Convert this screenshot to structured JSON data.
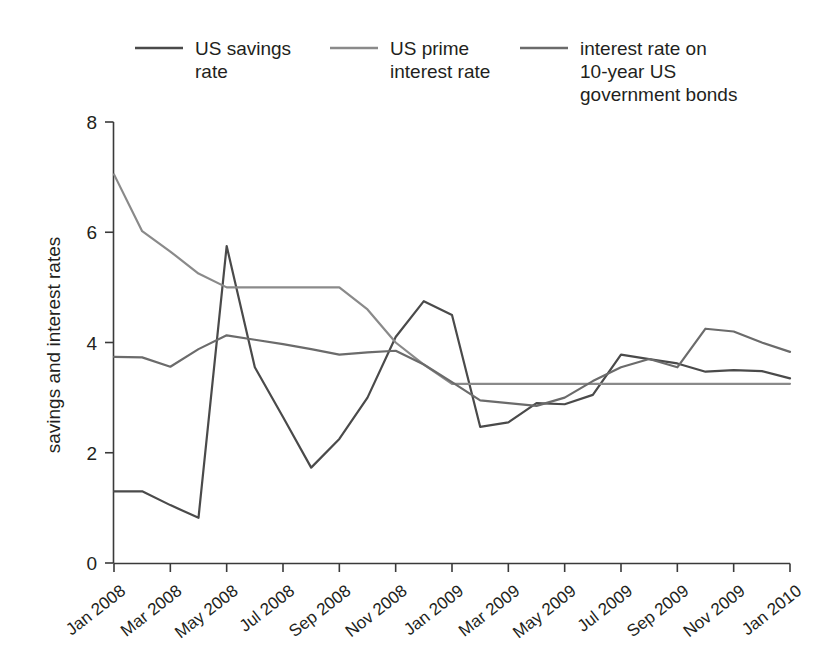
{
  "chart_data": {
    "type": "line",
    "title": "",
    "xlabel": "",
    "ylabel": "savings and interest rates",
    "ylim": [
      0,
      8
    ],
    "yticks": [
      0,
      2,
      4,
      6,
      8
    ],
    "grid": false,
    "legend_position": "top",
    "x": [
      "Jan 2008",
      "Feb 2008",
      "Mar 2008",
      "Apr 2008",
      "May 2008",
      "Jun 2008",
      "Jul 2008",
      "Aug 2008",
      "Sep 2008",
      "Oct 2008",
      "Nov 2008",
      "Dec 2008",
      "Jan 2009",
      "Feb 2009",
      "Mar 2009",
      "Apr 2009",
      "May 2009",
      "Jun 2009",
      "Jul 2009",
      "Aug 2009",
      "Sep 2009",
      "Oct 2009",
      "Nov 2009",
      "Dec 2009",
      "Jan 2010"
    ],
    "xtick_labels": [
      "Jan 2008",
      "Mar 2008",
      "May 2008",
      "Jul 2008",
      "Sep 2008",
      "Nov 2008",
      "Jan 2009",
      "Mar 2009",
      "May 2009",
      "Jul 2009",
      "Sep 2009",
      "Nov 2009",
      "Jan 2010"
    ],
    "xtick_indices": [
      0,
      2,
      4,
      6,
      8,
      10,
      12,
      14,
      16,
      18,
      20,
      22,
      24
    ],
    "series": [
      {
        "name": "US savings rate",
        "color": "#4a4a4a",
        "values": [
          1.3,
          1.3,
          1.05,
          0.82,
          5.75,
          3.55,
          2.65,
          1.73,
          2.25,
          3.0,
          4.1,
          4.75,
          4.5,
          2.47,
          2.55,
          2.9,
          2.88,
          3.05,
          3.78,
          3.7,
          3.62,
          3.47,
          3.5,
          3.48,
          3.35
        ]
      },
      {
        "name": "US prime interest rate",
        "color": "#8a8a8a",
        "values": [
          7.05,
          6.02,
          5.65,
          5.25,
          5.0,
          5.0,
          5.0,
          5.0,
          5.0,
          4.6,
          4.0,
          3.6,
          3.25,
          3.25,
          3.25,
          3.25,
          3.25,
          3.25,
          3.25,
          3.25,
          3.25,
          3.25,
          3.25,
          3.25,
          3.25
        ]
      },
      {
        "name": "interest rate on 10-year US government bonds",
        "color": "#6b6b6b",
        "values": [
          3.74,
          3.73,
          3.56,
          3.88,
          4.13,
          4.05,
          3.97,
          3.88,
          3.78,
          3.82,
          3.85,
          3.6,
          3.28,
          2.95,
          2.9,
          2.85,
          3.0,
          3.3,
          3.55,
          3.7,
          3.55,
          4.25,
          4.2,
          4.0,
          3.83
        ]
      }
    ]
  },
  "legend": {
    "items": [
      {
        "label_line1": "US savings",
        "label_line2": "rate",
        "label_line3": "",
        "color": "#4a4a4a"
      },
      {
        "label_line1": "US prime",
        "label_line2": "interest rate",
        "label_line3": "",
        "color": "#8a8a8a"
      },
      {
        "label_line1": "interest rate on",
        "label_line2": "10-year US",
        "label_line3": "government bonds",
        "color": "#6b6b6b"
      }
    ]
  },
  "axes": {
    "y_title": "savings and interest rates",
    "y_tick_0": "0",
    "y_tick_1": "2",
    "y_tick_2": "4",
    "y_tick_3": "6",
    "y_tick_4": "8"
  }
}
